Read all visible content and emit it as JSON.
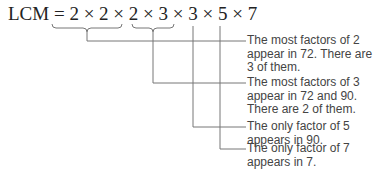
{
  "equation": {
    "label": "LCM",
    "expression": "= 2 × 2 × 2 × 3 × 3 × 5 × 7"
  },
  "annotations": [
    {
      "text": "The most factors of 2 appear in 72. There are 3 of them.",
      "lines": [
        "The most factors of 2",
        "appear in 72. There are",
        "3 of them."
      ]
    },
    {
      "text": "The most factors of 3 appear in 72 and 90. There are 2 of them.",
      "lines": [
        "The most factors of 3",
        "appear in 72 and 90.",
        "There are 2 of them."
      ]
    },
    {
      "text": "The only factor of 5 appears in 90.",
      "lines": [
        "The only factor of 5",
        "appears in 90."
      ]
    },
    {
      "text": "The only factor of 7 appears in 7.",
      "lines": [
        "The only factor of 7",
        "appears in 7."
      ]
    }
  ]
}
